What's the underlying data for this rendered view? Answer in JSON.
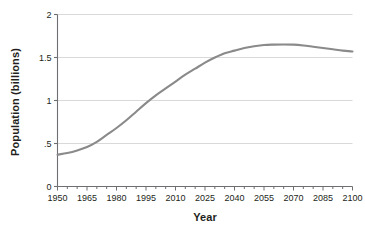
{
  "chart_data": {
    "type": "line",
    "title": "",
    "xlabel": "Year",
    "ylabel": "Population (billions)",
    "xlim": [
      1950,
      2100
    ],
    "ylim": [
      0,
      2
    ],
    "grid": "horizontal",
    "legend": "none",
    "line_color": "#8a8a8a",
    "axis_color": "#6d6e71",
    "grid_color": "#d9d9d9",
    "background_color": "#ffffff",
    "xticks": [
      1950,
      1965,
      1980,
      1995,
      2010,
      2025,
      2040,
      2055,
      2070,
      2085,
      2100
    ],
    "xtick_labels": [
      "1950",
      "1965",
      "1980",
      "1995",
      "2010",
      "2025",
      "2040",
      "2055",
      "2070",
      "2085",
      "2100"
    ],
    "xminor_step": 5,
    "yticks": [
      0,
      0.5,
      1,
      1.5,
      2
    ],
    "ytick_labels": [
      "0",
      ".5",
      "1",
      "1.5",
      "2"
    ],
    "series": [
      {
        "name": "Population",
        "x": [
          1950,
          1955,
          1960,
          1965,
          1970,
          1975,
          1980,
          1985,
          1990,
          1995,
          2000,
          2005,
          2010,
          2015,
          2020,
          2025,
          2030,
          2035,
          2040,
          2045,
          2050,
          2055,
          2060,
          2065,
          2070,
          2075,
          2080,
          2085,
          2090,
          2095,
          2100
        ],
        "values": [
          0.37,
          0.39,
          0.42,
          0.46,
          0.52,
          0.6,
          0.68,
          0.77,
          0.87,
          0.97,
          1.06,
          1.14,
          1.22,
          1.3,
          1.37,
          1.44,
          1.5,
          1.55,
          1.58,
          1.61,
          1.63,
          1.645,
          1.65,
          1.652,
          1.65,
          1.64,
          1.625,
          1.61,
          1.595,
          1.58,
          1.57
        ]
      }
    ]
  },
  "axes": {
    "y_title": "Population (billions)",
    "x_title": "Year"
  }
}
